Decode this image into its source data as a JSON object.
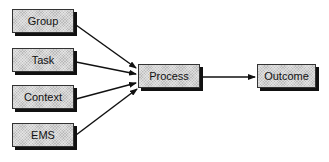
{
  "diagram": {
    "type": "flow",
    "nodes": [
      {
        "id": "group",
        "label": "Group"
      },
      {
        "id": "task",
        "label": "Task"
      },
      {
        "id": "context",
        "label": "Context"
      },
      {
        "id": "ems",
        "label": "EMS"
      },
      {
        "id": "process",
        "label": "Process"
      },
      {
        "id": "outcome",
        "label": "Outcome"
      }
    ],
    "edges": [
      {
        "from": "group",
        "to": "process"
      },
      {
        "from": "task",
        "to": "process"
      },
      {
        "from": "context",
        "to": "process"
      },
      {
        "from": "ems",
        "to": "process"
      },
      {
        "from": "process",
        "to": "outcome"
      }
    ]
  }
}
